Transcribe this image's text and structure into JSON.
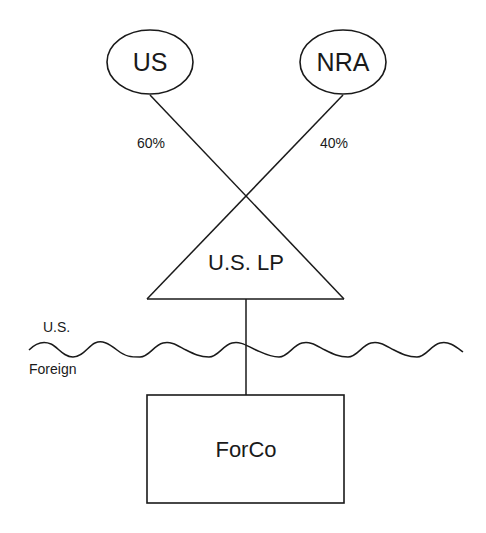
{
  "diagram": {
    "title": "",
    "nodes": {
      "us": {
        "label": "US",
        "shape": "ellipse"
      },
      "nra": {
        "label": "NRA",
        "shape": "ellipse"
      },
      "us_lp": {
        "label": "U.S. LP",
        "shape": "triangle"
      },
      "forco": {
        "label": "ForCo",
        "shape": "rectangle"
      }
    },
    "edges": [
      {
        "from": "US",
        "to": "U.S. LP",
        "label": "60%"
      },
      {
        "from": "NRA",
        "to": "U.S. LP",
        "label": "40%"
      },
      {
        "from": "U.S. LP",
        "to": "ForCo",
        "label": ""
      }
    ],
    "border": {
      "type": "wavy-line",
      "above_label": "U.S.",
      "below_label": "Foreign"
    },
    "colors": {
      "stroke": "#1a1a1a",
      "background": "#ffffff"
    }
  }
}
